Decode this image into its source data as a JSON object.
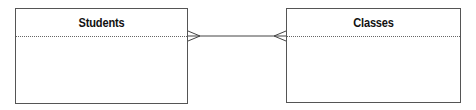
{
  "diagram": {
    "type": "entity-relationship",
    "entities": [
      {
        "name": "Students"
      },
      {
        "name": "Classes"
      }
    ],
    "relationship": {
      "from": "Students",
      "to": "Classes",
      "cardinality": "many-to-many",
      "notation": "crows-foot"
    },
    "colors": {
      "border": "#555555",
      "line": "#444444",
      "background": "#ffffff"
    }
  }
}
